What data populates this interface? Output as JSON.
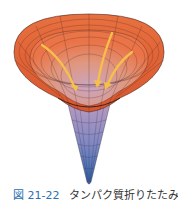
{
  "figure": {
    "arrow_count": 4,
    "colors": {
      "rim": "#e0653a",
      "mid": "#c8a0b8",
      "tip": "#3a6db0",
      "arrows": "#f6c04a",
      "grid": "#4a2a20"
    }
  },
  "caption": {
    "number": "図 21-22",
    "text": "タンパク質折りたたみ"
  }
}
